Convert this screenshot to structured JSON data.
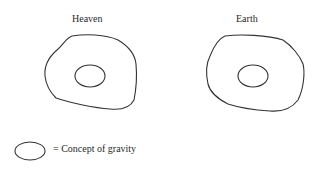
{
  "diagram": {
    "panels": [
      {
        "id": "heaven",
        "label": "Heaven",
        "contains": "Concept of gravity"
      },
      {
        "id": "earth",
        "label": "Earth",
        "contains": "Concept of gravity"
      }
    ],
    "legend": {
      "symbol": "ellipse",
      "text": "= Concept of gravity"
    }
  }
}
